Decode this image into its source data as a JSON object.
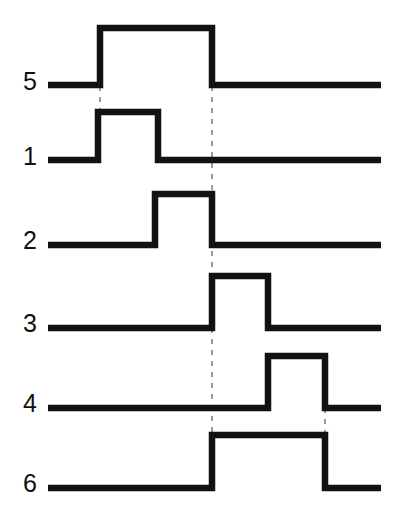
{
  "figure": {
    "type": "timing-waveform",
    "width": 401,
    "height": 510,
    "background_color": "#ffffff",
    "stroke_color": "#121212",
    "guide_color": "#9a9a9a"
  },
  "axis": {
    "x_start": 48,
    "x_end": 381,
    "time_unit": "arbitrary"
  },
  "chart_data": {
    "type": "line",
    "xlabel": "",
    "ylabel": "",
    "grid": false,
    "legend": "left-labels",
    "x_range": [
      48,
      381
    ],
    "transition_times": [
      100,
      158,
      212,
      268,
      325
    ],
    "series": [
      {
        "name": "5",
        "label": "5",
        "label_x": 30,
        "label_y": 83,
        "baseline_y": 85,
        "high_y": 28,
        "start_x": 48,
        "end_x": 381,
        "pulses": [
          {
            "rise": 100,
            "fall": 212
          }
        ],
        "values": [
          0,
          1,
          0
        ],
        "transitions": [
          100,
          212
        ]
      },
      {
        "name": "1",
        "label": "1",
        "label_x": 30,
        "label_y": 158,
        "baseline_y": 160,
        "high_y": 112,
        "start_x": 48,
        "end_x": 381,
        "pulses": [
          {
            "rise": 98,
            "fall": 158
          }
        ],
        "values": [
          0,
          1,
          0
        ],
        "transitions": [
          98,
          158
        ]
      },
      {
        "name": "2",
        "label": "2",
        "label_x": 30,
        "label_y": 242,
        "baseline_y": 245,
        "high_y": 194,
        "start_x": 48,
        "end_x": 381,
        "pulses": [
          {
            "rise": 155,
            "fall": 212
          }
        ],
        "values": [
          0,
          1,
          0
        ],
        "transitions": [
          155,
          212
        ]
      },
      {
        "name": "3",
        "label": "3",
        "label_x": 30,
        "label_y": 325,
        "baseline_y": 328,
        "high_y": 276,
        "start_x": 48,
        "end_x": 381,
        "pulses": [
          {
            "rise": 212,
            "fall": 268
          }
        ],
        "values": [
          0,
          1,
          0
        ],
        "transitions": [
          212,
          268
        ]
      },
      {
        "name": "4",
        "label": "4",
        "label_x": 30,
        "label_y": 405,
        "baseline_y": 408,
        "high_y": 356,
        "start_x": 48,
        "end_x": 381,
        "pulses": [
          {
            "rise": 268,
            "fall": 325
          }
        ],
        "values": [
          0,
          1,
          0
        ],
        "transitions": [
          268,
          325
        ]
      },
      {
        "name": "6",
        "label": "6",
        "label_x": 30,
        "label_y": 485,
        "baseline_y": 488,
        "high_y": 435,
        "start_x": 48,
        "end_x": 381,
        "pulses": [
          {
            "rise": 212,
            "fall": 325
          }
        ],
        "values": [
          0,
          1,
          0
        ],
        "transitions": [
          212,
          325
        ]
      }
    ],
    "guides": [
      {
        "name": "guide-t1",
        "x": 100,
        "y_top": 86,
        "y_bottom": 112
      },
      {
        "name": "guide-t3",
        "x": 212,
        "y_top": 86,
        "y_bottom": 436
      },
      {
        "name": "guide-t5",
        "x": 325,
        "y_top": 408,
        "y_bottom": 436
      }
    ]
  }
}
